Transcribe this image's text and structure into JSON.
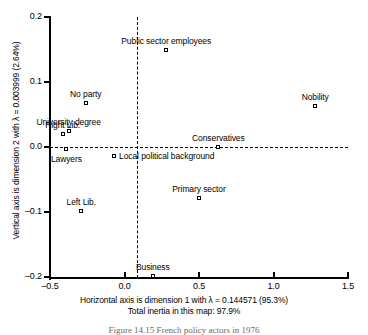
{
  "chart_data": {
    "type": "scatter",
    "title": "",
    "xlabel": "Horizontal axis is dimension 1 with λ = 0.144571 (95.3%)",
    "ylabel": "Vertical axis is dimension 2 with λ = 0.003999 (2.64%)",
    "xlim": [
      -0.5,
      1.5
    ],
    "ylim": [
      -0.2,
      0.2
    ],
    "xticks": [
      "-0.5",
      "0.0",
      "0.5",
      "1.0",
      "1.5"
    ],
    "xtick_values": [
      -0.5,
      0.0,
      0.5,
      1.0,
      1.5
    ],
    "yticks": [
      "0.2",
      "0.1",
      "0.0",
      "-0.1",
      "-0.2"
    ],
    "ytick_values": [
      0.2,
      0.1,
      0.0,
      -0.1,
      -0.2
    ],
    "grid": false,
    "legend": "none",
    "reference_lines": [
      {
        "orientation": "horizontal",
        "value": 0.0,
        "style": "dashed"
      },
      {
        "orientation": "vertical",
        "value": 0.0,
        "style": "dashed"
      }
    ],
    "annotations": [
      "Total inertia in this map: 97.9%"
    ],
    "points": [
      {
        "label": "Public sector employees",
        "x": 0.28,
        "y": 0.15,
        "label_pos": "above-center"
      },
      {
        "label": "Nobility",
        "x": 1.28,
        "y": 0.063,
        "label_pos": "above-center"
      },
      {
        "label": "No party",
        "x": -0.26,
        "y": 0.068,
        "label_pos": "above-center"
      },
      {
        "label": "University degree",
        "x": -0.375,
        "y": 0.025,
        "label_pos": "above-center"
      },
      {
        "label": "Right Lib.",
        "x": -0.415,
        "y": 0.02,
        "label_pos": "above-center"
      },
      {
        "label": "Lawyers",
        "x": -0.39,
        "y": -0.003,
        "label_pos": "below-center"
      },
      {
        "label": "Conservatives",
        "x": 0.63,
        "y": 0.0,
        "label_pos": "above-center"
      },
      {
        "label": "Local political background",
        "x": -0.07,
        "y": -0.014,
        "label_pos": "right"
      },
      {
        "label": "Primary sector",
        "x": 0.5,
        "y": -0.079,
        "label_pos": "above-center"
      },
      {
        "label": "Left Lib.",
        "x": -0.29,
        "y": -0.098,
        "label_pos": "above-center"
      },
      {
        "label": "Business",
        "x": 0.19,
        "y": -0.198,
        "label_pos": "above-center"
      }
    ]
  },
  "axis": {
    "x_title": "Horizontal axis is dimension 1 with λ = 0.144571 (95.3%)",
    "y_title": "Vertical axis is dimension 2 with λ = 0.003999 (2.64%)",
    "inertia_note": "Total inertia in this map: 97.9%"
  },
  "caption": {
    "text": "Figure 14.15   French policy actors in 1976"
  }
}
